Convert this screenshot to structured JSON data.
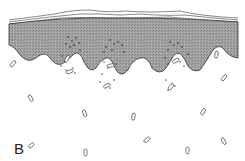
{
  "figure": {
    "panel_label": "B"
  },
  "colors": {
    "epidermis": "#9a9a9a",
    "outline": "#333333",
    "dots": "#222222"
  }
}
